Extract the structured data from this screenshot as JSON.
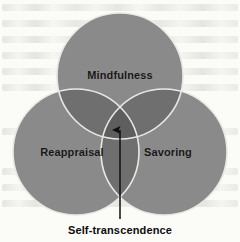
{
  "figure": {
    "type": "venn-diagram-3-set",
    "width": 240,
    "height": 242,
    "background_color": "#fbfbf8",
    "circle_fill_color": "#8a8a8a",
    "circle_outline_color": "#e8e8e4",
    "overlap_color_pair": "#6f6f6f",
    "overlap_color_triple": "#5e5e5e",
    "arrow_color": "#101010"
  },
  "circles": [
    {
      "id": "mindfulness",
      "label": "Mindfulness",
      "cx": 120,
      "cy": 76,
      "r": 63
    },
    {
      "id": "reappraisal",
      "label": "Reappraisal",
      "cx": 76,
      "cy": 152,
      "r": 63
    },
    {
      "id": "savoring",
      "label": "Savoring",
      "cx": 164,
      "cy": 152,
      "r": 63
    }
  ],
  "arrow": {
    "name": "self-transcendence-arrow",
    "x": 120,
    "tail_y": 219,
    "head_y": 121,
    "direction": "up"
  },
  "caption": {
    "text": "Self-transcendence"
  }
}
